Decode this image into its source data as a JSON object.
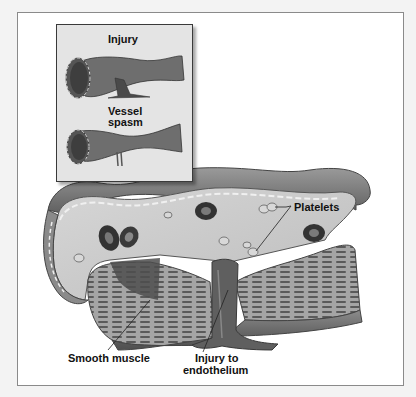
{
  "figure": {
    "inset": {
      "labels": {
        "injury": "Injury",
        "vessel_spasm_line1": "Vessel",
        "vessel_spasm_line2": "spasm"
      }
    },
    "main": {
      "labels": {
        "platelets": "Platelets",
        "smooth_muscle": "Smooth muscle",
        "injury_line1": "Injury to",
        "injury_line2": "endothelium"
      }
    },
    "colors": {
      "background": "#f3f3f3",
      "frame": "#ffffff",
      "inset_bg": "#e4e4e4",
      "vessel_wall": "#7a7a7a",
      "vessel_dark": "#4a4a4a",
      "lumen": "#c9c9c9",
      "rbc": "#3a3a3a"
    }
  }
}
